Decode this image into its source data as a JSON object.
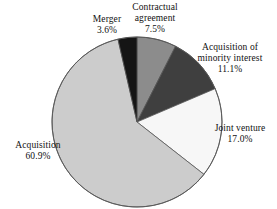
{
  "chart_data": {
    "type": "pie",
    "title": "",
    "subtitle": "",
    "xlabel": "",
    "ylabel": "",
    "legend_position": "none",
    "grid": false,
    "start_angle_deg": 0,
    "direction": "clockwise",
    "categories": [
      "Contractual agreement",
      "Acquisition of minority interest",
      "Joint venture",
      "Acquisition",
      "Merger"
    ],
    "values": [
      7.5,
      11.1,
      17.0,
      60.9,
      3.6
    ],
    "value_labels": [
      "7.5%",
      "11.1%",
      "17.0%",
      "60.9%",
      "3.6%"
    ],
    "units": "percent",
    "slices": [
      {
        "name": "Contractual agreement",
        "label_line1": "Contractual",
        "label_line2": "agreement",
        "value": 7.5,
        "value_label": "7.5%",
        "color": "#8c8c8c"
      },
      {
        "name": "Acquisition of minority interest",
        "label_line1": "Acquisition of",
        "label_line2": "minority interest",
        "value": 11.1,
        "value_label": "11.1%",
        "color": "#3f3f3f"
      },
      {
        "name": "Joint venture",
        "label_line1": "Joint venture",
        "label_line2": "",
        "value": 17.0,
        "value_label": "17.0%",
        "color": "#f7f7f7"
      },
      {
        "name": "Acquisition",
        "label_line1": "Acquisition",
        "label_line2": "",
        "value": 60.9,
        "value_label": "60.9%",
        "color": "#cccccc"
      },
      {
        "name": "Merger",
        "label_line1": "Merger",
        "label_line2": "",
        "value": 3.6,
        "value_label": "3.6%",
        "color": "#151515"
      }
    ],
    "outline_color": "#555555",
    "background": "#ffffff"
  },
  "labels": {
    "merger": {
      "name": "Merger",
      "value": "3.6%"
    },
    "contractual": {
      "line1": "Contractual",
      "line2": "agreement",
      "value": "7.5%"
    },
    "minority": {
      "line1": "Acquisition of",
      "line2": "minority interest",
      "value": "11.1%"
    },
    "joint": {
      "name": "Joint venture",
      "value": "17.0%"
    },
    "acquisition": {
      "name": "Acquisition",
      "value": "60.9%"
    }
  }
}
